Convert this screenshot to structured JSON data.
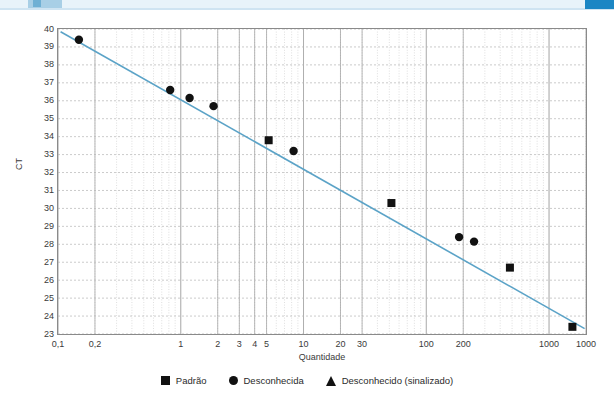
{
  "decor": {
    "top_band_color": "#e8f3fa",
    "top_right_chip_color": "#1b86c4",
    "top_left_chip_color": "#a8cfe6"
  },
  "chart_data": {
    "type": "scatter",
    "title": "",
    "xlabel": "Quantidade",
    "ylabel": "CT",
    "xscale": "log",
    "yscale": "linear",
    "xlim": [
      0.1,
      2000
    ],
    "ylim": [
      23,
      40
    ],
    "grid": true,
    "legend_position": "bottom",
    "line_color": "#5ba3c7",
    "marker_color": "#111111",
    "x_ticks": [
      {
        "value": 0.1,
        "label": "0,1"
      },
      {
        "value": 0.2,
        "label": "0,2"
      },
      {
        "value": 1,
        "label": "1"
      },
      {
        "value": 2,
        "label": "2"
      },
      {
        "value": 3,
        "label": "3"
      },
      {
        "value": 4,
        "label": "4"
      },
      {
        "value": 5,
        "label": "5"
      },
      {
        "value": 10,
        "label": "10"
      },
      {
        "value": 20,
        "label": "20"
      },
      {
        "value": 30,
        "label": "30"
      },
      {
        "value": 100,
        "label": "100"
      },
      {
        "value": 200,
        "label": "200"
      },
      {
        "value": 1000,
        "label": "1000"
      },
      {
        "value": 2000,
        "label": "1000"
      }
    ],
    "y_ticks": [
      {
        "value": 40,
        "label": "40"
      },
      {
        "value": 39,
        "label": "39"
      },
      {
        "value": 38,
        "label": "38"
      },
      {
        "value": 37,
        "label": "37"
      },
      {
        "value": 36,
        "label": "36"
      },
      {
        "value": 35,
        "label": "35"
      },
      {
        "value": 34,
        "label": "34"
      },
      {
        "value": 33,
        "label": "33"
      },
      {
        "value": 32,
        "label": "32"
      },
      {
        "value": 31,
        "label": "31"
      },
      {
        "value": 30,
        "label": "30"
      },
      {
        "value": 29,
        "label": "29"
      },
      {
        "value": 28,
        "label": "28"
      },
      {
        "value": 27,
        "label": "27"
      },
      {
        "value": 26,
        "label": "26"
      },
      {
        "value": 25,
        "label": "25"
      },
      {
        "value": 24,
        "label": "24"
      },
      {
        "value": 23,
        "label": "23"
      }
    ],
    "trendline": {
      "x": [
        0.105,
        1950
      ],
      "y": [
        39.85,
        23.3
      ]
    },
    "series": [
      {
        "name": "Padrão",
        "marker": "square",
        "points": [
          {
            "x": 5.2,
            "y": 33.8
          },
          {
            "x": 52,
            "y": 30.3
          },
          {
            "x": 480,
            "y": 26.7
          },
          {
            "x": 1550,
            "y": 23.4
          }
        ]
      },
      {
        "name": "Desconhecida",
        "marker": "circle",
        "points": [
          {
            "x": 0.148,
            "y": 39.4
          },
          {
            "x": 0.82,
            "y": 36.6
          },
          {
            "x": 1.18,
            "y": 36.15
          },
          {
            "x": 1.85,
            "y": 35.7
          },
          {
            "x": 8.3,
            "y": 33.2
          },
          {
            "x": 185,
            "y": 28.4
          },
          {
            "x": 245,
            "y": 28.15
          }
        ]
      },
      {
        "name": "Desconhecido (sinalizado)",
        "marker": "triangle",
        "points": []
      }
    ]
  },
  "legend": {
    "items": [
      {
        "label": "Padrão",
        "marker": "square"
      },
      {
        "label": "Desconhecida",
        "marker": "circle"
      },
      {
        "label": "Desconhecido (sinalizado)",
        "marker": "triangle"
      }
    ]
  }
}
